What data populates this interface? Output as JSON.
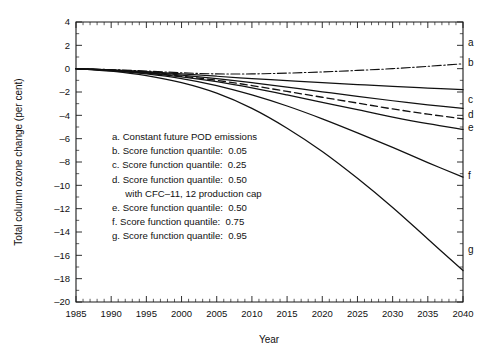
{
  "chart_data": {
    "type": "line",
    "title": "",
    "xlabel": "Year",
    "ylabel": "Total column ozone change (per cent)",
    "xlim": [
      1985,
      2040
    ],
    "ylim": [
      -20,
      4
    ],
    "xticks": [
      1985,
      1990,
      1995,
      2000,
      2005,
      2010,
      2015,
      2020,
      2025,
      2030,
      2035,
      2040
    ],
    "yticks": [
      4,
      2,
      0,
      -2,
      -4,
      -6,
      -8,
      -10,
      -12,
      -14,
      -16,
      -18,
      -20
    ],
    "x_minor_tick_step": 1,
    "grid": false,
    "legend_position": "inside-left",
    "x": [
      1985,
      1990,
      1995,
      2000,
      2005,
      2010,
      2015,
      2020,
      2025,
      2030,
      2035,
      2040
    ],
    "series": [
      {
        "name": "a",
        "label": "a",
        "style": "dash-dot",
        "legend": "a. Constant future POD emissions",
        "values": [
          0.0,
          -0.08,
          -0.2,
          -0.35,
          -0.45,
          -0.45,
          -0.38,
          -0.28,
          -0.15,
          0.0,
          0.2,
          0.42
        ]
      },
      {
        "name": "b",
        "label": "b",
        "style": "solid",
        "legend": "b. Score function quantile:  0.05",
        "values": [
          0.0,
          -0.1,
          -0.25,
          -0.45,
          -0.65,
          -0.85,
          -1.02,
          -1.2,
          -1.36,
          -1.52,
          -1.67,
          -1.8
        ]
      },
      {
        "name": "c",
        "label": "c",
        "style": "solid",
        "legend": "c. Score function quantile:  0.25",
        "values": [
          0.0,
          -0.12,
          -0.3,
          -0.55,
          -0.85,
          -1.2,
          -1.58,
          -1.98,
          -2.38,
          -2.75,
          -3.1,
          -3.4
        ]
      },
      {
        "name": "d",
        "label": "d",
        "style": "dashed",
        "legend": "d. Score function quantile:  0.50",
        "legend_line2": "with CFC–11, 12 production cap",
        "values": [
          0.0,
          -0.14,
          -0.35,
          -0.65,
          -1.0,
          -1.45,
          -1.95,
          -2.45,
          -2.95,
          -3.45,
          -3.9,
          -4.3
        ]
      },
      {
        "name": "e",
        "label": "e",
        "style": "solid",
        "legend": "e. Score function quantile:  0.50",
        "values": [
          0.0,
          -0.15,
          -0.38,
          -0.7,
          -1.12,
          -1.65,
          -2.25,
          -2.88,
          -3.52,
          -4.15,
          -4.72,
          -5.2
        ]
      },
      {
        "name": "f",
        "label": "f",
        "style": "solid",
        "legend": "f. Score function quantile:  0.75",
        "values": [
          0.0,
          -0.18,
          -0.45,
          -0.85,
          -1.45,
          -2.25,
          -3.2,
          -4.3,
          -5.5,
          -6.75,
          -8.05,
          -9.3
        ]
      },
      {
        "name": "g",
        "label": "g",
        "style": "solid",
        "legend": "g. Score function quantile:  0.95",
        "values": [
          0.0,
          -0.22,
          -0.6,
          -1.2,
          -2.1,
          -3.4,
          -5.1,
          -7.1,
          -9.4,
          -11.9,
          -14.6,
          -17.3
        ]
      }
    ],
    "legend_entries": [
      "a. Constant future POD emissions",
      "b. Score function quantile:  0.05",
      "c. Score function quantile:  0.25",
      "d. Score function quantile:  0.50",
      "     with CFC–11, 12 production cap",
      "e. Score function quantile:  0.50",
      "f. Score function quantile:  0.75",
      "g. Score function quantile:  0.95"
    ]
  }
}
